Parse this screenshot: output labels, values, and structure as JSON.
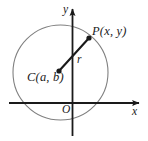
{
  "figure": {
    "background_color": "#ffffff",
    "axis_color": "#1a1a1a",
    "circle_color": "#808080",
    "radius_color": "#1a1a1a",
    "point_color": "#1a1a1a",
    "label_color": "#1a1a1a"
  },
  "labels": {
    "point_p": "P(x, y)",
    "center_c": "C(a, b)",
    "radius_r": "r",
    "origin_o": "O",
    "axis_x": "x",
    "axis_y": "y"
  },
  "geometry": {
    "circle": {
      "cx": 60.5,
      "cy": 72.5,
      "r": 47.5
    },
    "center_point": {
      "x": 59,
      "y": 71
    },
    "point_p": {
      "x": 89,
      "y": 38
    },
    "x_axis": {
      "x1": 9,
      "y1": 103,
      "x2": 141,
      "y2": 103
    },
    "y_axis": {
      "x1": 72.5,
      "y1": 136,
      "x2": 72.5,
      "y2": 7
    },
    "origin": {
      "x": 72.5,
      "y": 103
    }
  }
}
